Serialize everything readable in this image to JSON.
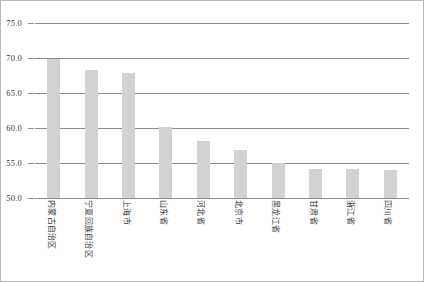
{
  "chart_data": {
    "type": "bar",
    "title": "",
    "subtitle": "",
    "xlabel": "",
    "ylabel": "",
    "ylim": [
      50.0,
      75.0
    ],
    "ytick_labels": [
      "75.0",
      "70.0",
      "65.0",
      "60.0",
      "55.0",
      "50.0"
    ],
    "ytick_values": [
      75.0,
      70.0,
      65.0,
      60.0,
      55.0,
      50.0
    ],
    "grid": true,
    "legend": "none",
    "bar_color": "#d2d2d2",
    "axis_color": "#8c8c8c",
    "categories": [
      "内蒙古自治区",
      "宁夏回族自治区",
      "上海市",
      "山东省",
      "河北省",
      "北京市",
      "黑龙江省",
      "甘肃省",
      "浙江省",
      "四川省"
    ],
    "values": [
      69.8,
      68.3,
      67.9,
      60.2,
      58.1,
      56.8,
      55.0,
      54.2,
      54.2,
      54.0
    ]
  }
}
